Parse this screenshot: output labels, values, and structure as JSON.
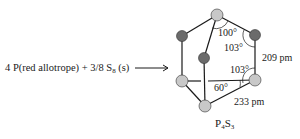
{
  "reaction": {
    "reactant1_coef": "4",
    "reactant1": "P(red allotrope)",
    "plus": "+",
    "reactant2_coef": "3/8",
    "reactant2_base": "S",
    "reactant2_sub": "8",
    "reactant2_state": "(s)"
  },
  "product": {
    "el1": "P",
    "sub1": "4",
    "el2": "S",
    "sub2": "3"
  },
  "angles": {
    "a1": "100°",
    "a2": "103°",
    "a3": "103°",
    "a4": "60°"
  },
  "bonds": {
    "ps": "209 pm",
    "pp": "233 pm"
  },
  "colors": {
    "phosphorus": "#c8c8c8",
    "sulfur": "#6b6b6b",
    "bond": "#1a1a1a"
  }
}
